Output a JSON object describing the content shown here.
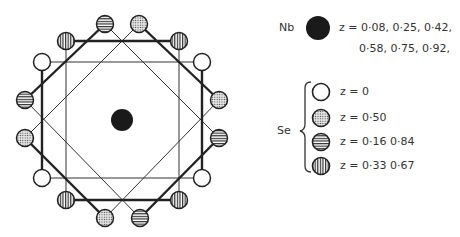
{
  "legend": {
    "nb": {
      "label": "Nb",
      "pattern": "solid-black",
      "z_line1": "z = 0·08,  0·25, 0·42,",
      "z_line2": "0·58,  0·75, 0·92,"
    },
    "se": {
      "label": "Se",
      "entries": [
        {
          "pattern": "open",
          "z": "z = 0"
        },
        {
          "pattern": "dotted",
          "z": "z = 0·50"
        },
        {
          "pattern": "horizontal-stripes",
          "z": "z = 0·16   0·84"
        },
        {
          "pattern": "vertical-stripes",
          "z": "z = 0·33  0·67"
        }
      ]
    }
  },
  "diagram": {
    "center_atom": {
      "species": "Nb",
      "x": 122,
      "y": 120
    },
    "se_atoms": [
      {
        "x": 105,
        "y": 24,
        "pattern": "horizontal-stripes"
      },
      {
        "x": 139,
        "y": 24,
        "pattern": "dotted"
      },
      {
        "x": 66,
        "y": 41,
        "pattern": "vertical-stripes"
      },
      {
        "x": 179,
        "y": 41,
        "pattern": "vertical-stripes"
      },
      {
        "x": 42,
        "y": 62,
        "pattern": "open"
      },
      {
        "x": 202,
        "y": 62,
        "pattern": "open"
      },
      {
        "x": 25,
        "y": 100,
        "pattern": "horizontal-stripes"
      },
      {
        "x": 219,
        "y": 100,
        "pattern": "dotted"
      },
      {
        "x": 25,
        "y": 138,
        "pattern": "dotted"
      },
      {
        "x": 219,
        "y": 138,
        "pattern": "horizontal-stripes"
      },
      {
        "x": 42,
        "y": 178,
        "pattern": "open"
      },
      {
        "x": 202,
        "y": 178,
        "pattern": "open"
      },
      {
        "x": 66,
        "y": 200,
        "pattern": "vertical-stripes"
      },
      {
        "x": 179,
        "y": 200,
        "pattern": "vertical-stripes"
      },
      {
        "x": 105,
        "y": 218,
        "pattern": "dotted"
      },
      {
        "x": 140,
        "y": 218,
        "pattern": "horizontal-stripes"
      }
    ]
  }
}
